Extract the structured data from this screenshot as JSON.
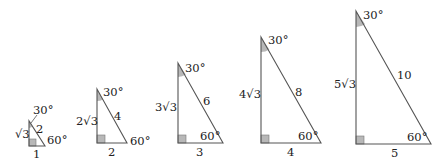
{
  "diagram": {
    "colors": {
      "stroke": "#555555",
      "shade": "#b8b8b8",
      "text": "#222222"
    },
    "triangles": [
      {
        "short_leg": "1",
        "long_leg": "√3",
        "hypotenuse": "2",
        "top_angle": "30°",
        "bottom_angle": "60°",
        "geom": {
          "x": 29,
          "yb": 146,
          "yt": 121,
          "xr": 45
        }
      },
      {
        "short_leg": "2",
        "long_leg": "2√3",
        "hypotenuse": "4",
        "top_angle": "30°",
        "bottom_angle": "60°",
        "geom": {
          "x": 97,
          "yb": 143,
          "yt": 89,
          "xr": 127
        }
      },
      {
        "short_leg": "3",
        "long_leg": "3√3",
        "hypotenuse": "6",
        "top_angle": "30°",
        "bottom_angle": "60°",
        "geom": {
          "x": 178,
          "yb": 143,
          "yt": 63,
          "xr": 223
        }
      },
      {
        "short_leg": "4",
        "long_leg": "4√3",
        "hypotenuse": "8",
        "top_angle": "30°",
        "bottom_angle": "60°",
        "geom": {
          "x": 261,
          "yb": 143,
          "yt": 37,
          "xr": 321
        }
      },
      {
        "short_leg": "5",
        "long_leg": "5√3",
        "hypotenuse": "10",
        "top_angle": "30°",
        "bottom_angle": "60°",
        "geom": {
          "x": 356,
          "yb": 144,
          "yt": 11,
          "xr": 431
        }
      }
    ]
  }
}
